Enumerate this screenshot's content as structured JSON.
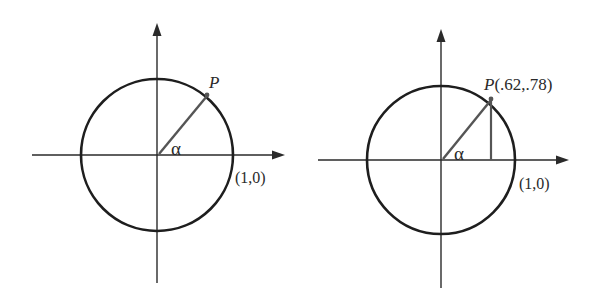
{
  "figures": [
    {
      "id": "left",
      "point_label": "P",
      "angle_label": "α",
      "unit_point_label": "(1,0)",
      "center": [
        157,
        155
      ],
      "radius": 76,
      "point": [
        207,
        96
      ],
      "show_vertical_segment": false
    },
    {
      "id": "right",
      "point_label": "P",
      "point_coords": "(.62,.78)",
      "angle_label": "α",
      "unit_point_label": "(1,0)",
      "center": [
        441,
        160
      ],
      "radius": 74,
      "point": [
        491,
        100
      ],
      "show_vertical_segment": true
    }
  ],
  "colors": {
    "circle": "#1e1e1e",
    "axis": "#2a2a2a",
    "radius": "#555555",
    "background": "#ffffff"
  }
}
